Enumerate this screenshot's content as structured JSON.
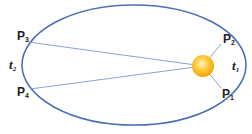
{
  "diagram": {
    "colors": {
      "orbit": "#4a6fb5",
      "radius_lines": "#7f98c9",
      "sun_core": "#fff2b0",
      "sun_mid": "#ffcc33",
      "sun_edge": "#f5a300",
      "label": "#222222"
    },
    "labels": {
      "p1": {
        "letter": "P",
        "sub": "1"
      },
      "p2": {
        "letter": "P",
        "sub": "2"
      },
      "p3": {
        "letter": "P",
        "sub": "3"
      },
      "p4": {
        "letter": "P",
        "sub": "4"
      },
      "t1": {
        "letter": "t",
        "sub": "1"
      },
      "t2": {
        "letter": "t",
        "sub": "2"
      }
    }
  }
}
